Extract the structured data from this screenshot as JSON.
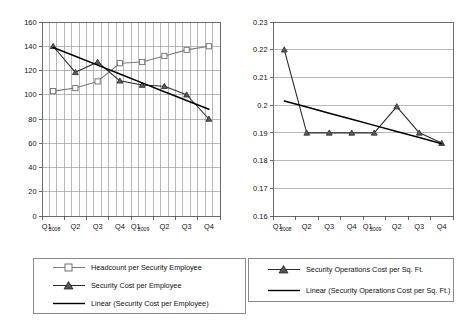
{
  "chart_data": [
    {
      "id": "left",
      "type": "line",
      "title": "",
      "xlabel": "",
      "ylabel": "",
      "ylim": [
        0,
        160
      ],
      "ystep": 20,
      "ytick_labels": [
        "0",
        "20",
        "40",
        "60",
        "80",
        "100",
        "120",
        "140",
        "160"
      ],
      "grid": "both",
      "legend_position": "bottom",
      "categories": [
        "Q1",
        "Q2",
        "Q3",
        "Q4",
        "Q1",
        "Q2",
        "Q3",
        "Q4"
      ],
      "category_sublabels": [
        "2008",
        "",
        "",
        "",
        "2009",
        "",
        "",
        ""
      ],
      "series": [
        {
          "name": "Headcount per Security Employee",
          "marker": "open-square",
          "color": "#7a7a7a",
          "values": [
            103,
            105.5,
            111,
            126,
            127,
            132,
            137,
            140
          ]
        },
        {
          "name": "Security Cost per Employee",
          "marker": "triangle",
          "color": "#2b2b2b",
          "values": [
            140,
            118.5,
            127,
            111.5,
            108,
            107,
            100,
            80
          ]
        },
        {
          "name": "Linear (Security Cost per Employee)",
          "marker": "none",
          "color": "#000000",
          "trendline": true,
          "values": [
            139,
            131.7,
            124.4,
            117.1,
            109.8,
            102.5,
            95.2,
            88
          ]
        }
      ]
    },
    {
      "id": "right",
      "type": "line",
      "title": "",
      "xlabel": "",
      "ylabel": "",
      "ylim": [
        0.16,
        0.23
      ],
      "ystep": 0.01,
      "ytick_labels": [
        "0.16",
        "0.17",
        "0.18",
        "0.19",
        "0.2",
        "0.21",
        "0.22",
        "0.23"
      ],
      "grid": "horizontal",
      "legend_position": "bottom",
      "categories": [
        "Q1",
        "Q2",
        "Q3",
        "Q4",
        "Q1",
        "Q2",
        "Q3",
        "Q4"
      ],
      "category_sublabels": [
        "2008",
        "",
        "",
        "",
        "2009",
        "",
        "",
        ""
      ],
      "series": [
        {
          "name": "Security Operations Cost per Sq. Ft.",
          "marker": "triangle",
          "color": "#2b2b2b",
          "values": [
            0.22,
            0.19,
            0.19,
            0.19,
            0.19,
            0.1995,
            0.19,
            0.1863
          ]
        },
        {
          "name": "Linear (Security Operations Cost per Sq. Ft.)",
          "marker": "none",
          "color": "#000000",
          "trendline": true,
          "values": [
            0.2015,
            0.1993,
            0.1971,
            0.1949,
            0.1927,
            0.1905,
            0.1883,
            0.1861
          ]
        }
      ]
    }
  ],
  "legends": {
    "left": [
      {
        "label": "Headcount per Security Employee",
        "marker": "open-square"
      },
      {
        "label": "Security Cost per Employee",
        "marker": "triangle"
      },
      {
        "label": "Linear (Security Cost per Employee)",
        "marker": "none"
      }
    ],
    "right": [
      {
        "label": "Security Operations Cost per Sq. Ft.",
        "marker": "triangle"
      },
      {
        "label": "Linear (Security Operations Cost per Sq. Ft.)",
        "marker": "none"
      }
    ]
  }
}
